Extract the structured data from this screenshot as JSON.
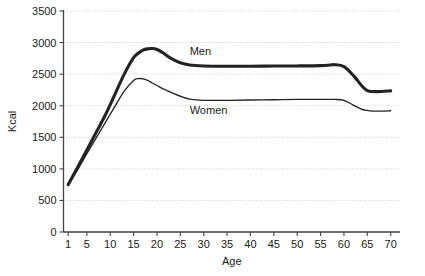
{
  "chart_data": {
    "type": "line",
    "title": "",
    "xlabel": "Age",
    "ylabel": "Kcal",
    "xlim": [
      0,
      72
    ],
    "ylim": [
      0,
      3500
    ],
    "grid": true,
    "legend_position": "inline-annotations",
    "x_tick_labels": [
      "1",
      "5",
      "10",
      "15",
      "20",
      "25",
      "30",
      "35",
      "40",
      "45",
      "50",
      "55",
      "60",
      "65",
      "70"
    ],
    "x_ticks": [
      1,
      5,
      10,
      15,
      20,
      25,
      30,
      35,
      40,
      45,
      50,
      55,
      60,
      65,
      70
    ],
    "y_tick_labels": [
      "0",
      "500",
      "1000",
      "1500",
      "2000",
      "2500",
      "3000",
      "3500"
    ],
    "y_ticks": [
      0,
      500,
      1000,
      1500,
      2000,
      2500,
      3000,
      3500
    ],
    "x": [
      1,
      3,
      5,
      7,
      9,
      11,
      13,
      15,
      16,
      17,
      18,
      19,
      20,
      21,
      22,
      23,
      25,
      27,
      30,
      35,
      40,
      45,
      50,
      55,
      57,
      58,
      60,
      62,
      64,
      65,
      66,
      68,
      70
    ],
    "series": [
      {
        "name": "Men",
        "label": "Men",
        "color": "#232323",
        "line_width": "thick",
        "values": [
          750,
          1020,
          1300,
          1580,
          1860,
          2180,
          2500,
          2760,
          2830,
          2880,
          2900,
          2905,
          2890,
          2850,
          2800,
          2750,
          2680,
          2645,
          2630,
          2625,
          2625,
          2628,
          2630,
          2635,
          2645,
          2650,
          2620,
          2480,
          2300,
          2240,
          2225,
          2225,
          2235
        ]
      },
      {
        "name": "Women",
        "label": "Women",
        "color": "#232323",
        "line_width": "thin",
        "values": [
          745,
          985,
          1240,
          1490,
          1740,
          1990,
          2230,
          2400,
          2430,
          2425,
          2400,
          2360,
          2320,
          2280,
          2245,
          2210,
          2150,
          2105,
          2085,
          2085,
          2090,
          2095,
          2100,
          2100,
          2100,
          2100,
          2085,
          2010,
          1940,
          1925,
          1915,
          1915,
          1920
        ]
      }
    ],
    "annotations": [
      {
        "text": "Men",
        "x": 27,
        "y": 2800
      },
      {
        "text": "Women",
        "x": 27,
        "y": 1870
      }
    ]
  }
}
